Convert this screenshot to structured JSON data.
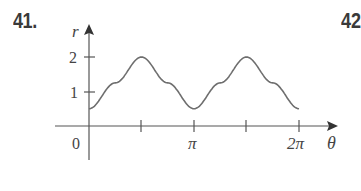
{
  "problem": {
    "number": "41.",
    "next_number_partial": "42"
  },
  "chart_data": {
    "type": "line",
    "title": "",
    "xlabel": "θ",
    "ylabel": "r",
    "x_ticks": [
      {
        "value": 0,
        "label": "0"
      },
      {
        "value": 1.5708,
        "label": ""
      },
      {
        "value": 3.1416,
        "label": "π"
      },
      {
        "value": 4.7124,
        "label": ""
      },
      {
        "value": 6.2832,
        "label": "2π"
      }
    ],
    "y_ticks": [
      {
        "value": 1,
        "label": "1"
      },
      {
        "value": 2,
        "label": "2"
      }
    ],
    "xlim": [
      0,
      6.2832
    ],
    "ylim": [
      0,
      2.5
    ],
    "grid": false,
    "series": [
      {
        "name": "r(θ)",
        "x": [
          0,
          0.785,
          1.5708,
          2.356,
          3.1416,
          3.927,
          4.7124,
          5.498,
          6.2832
        ],
        "values": [
          0.5,
          1.25,
          2,
          1.25,
          0.5,
          1.25,
          2,
          1.25,
          0.5
        ]
      }
    ],
    "colors": {
      "curve": "#6e6e6e",
      "axes": "#555555"
    }
  }
}
